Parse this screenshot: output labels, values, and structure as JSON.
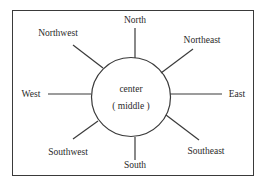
{
  "diagram": {
    "title": "",
    "center": {
      "line1": "center",
      "line2": "( middle )"
    },
    "directions": {
      "north": "North",
      "northeast": "Northeast",
      "east": "East",
      "southeast": "Southeast",
      "south": "South",
      "southwest": "Southwest",
      "west": "West",
      "northwest": "Northwest"
    },
    "colors": {
      "line": "#3a3a3a",
      "text": "#2a2a2a",
      "background": "#ffffff"
    }
  }
}
